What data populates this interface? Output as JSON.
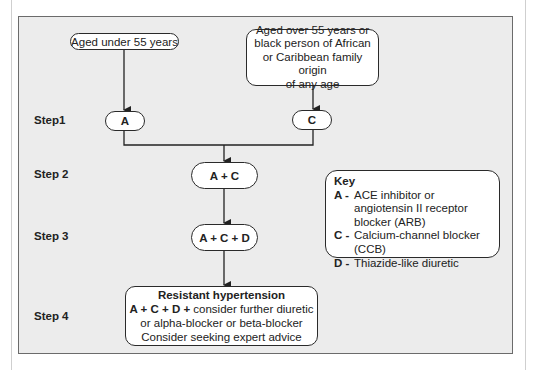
{
  "diagram": {
    "start_nodes": {
      "under55": "Aged under 55 years",
      "over55": "Aged over 55 years or black person of African or Caribbean family origin of any age",
      "over55_lines": [
        "Aged over 55 years or",
        "black person of African",
        "or Caribbean family origin",
        "of any age"
      ]
    },
    "steps": [
      {
        "label": "Step1",
        "nodes": [
          "A",
          "C"
        ]
      },
      {
        "label": "Step 2",
        "nodes": [
          "A + C"
        ]
      },
      {
        "label": "Step 3",
        "nodes": [
          "A + C + D"
        ]
      },
      {
        "label": "Step 4",
        "nodes": [
          "Resistant hypertension"
        ]
      }
    ],
    "step4_box": {
      "title": "Resistant hypertension",
      "bold_prefix": "A + C + D +",
      "line1_rest": " consider further diuretic",
      "line2": "or alpha-blocker or beta-blocker",
      "line3": "Consider seeking expert advice"
    },
    "key": {
      "title": "Key",
      "items": [
        {
          "letter": "A -",
          "text": "ACE inhibitor or angiotensin II receptor blocker (ARB)"
        },
        {
          "letter": "C -",
          "text": "Calcium-channel blocker (CCB)"
        },
        {
          "letter": "D -",
          "text": "Thiazide-like diuretic"
        }
      ]
    },
    "colors": {
      "panel": "#ececec",
      "border": "#2a2a2a",
      "node_fill": "#ffffff"
    }
  }
}
